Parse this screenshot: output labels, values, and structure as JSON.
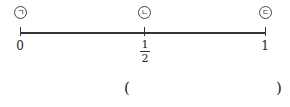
{
  "number_line": {
    "start": 0,
    "end": 1,
    "points": [
      {
        "marker": "ㄱ",
        "label": "0"
      },
      {
        "marker": "ㄴ",
        "numerator": "1",
        "denominator": "2"
      },
      {
        "marker": "ㄷ",
        "label": "1"
      }
    ]
  },
  "answer": {
    "open_paren": "(",
    "value": "",
    "close_paren": ")"
  }
}
